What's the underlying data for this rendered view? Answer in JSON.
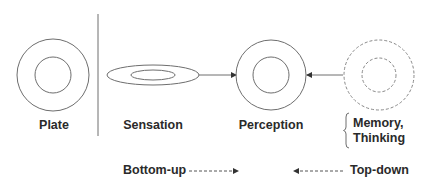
{
  "diagram": {
    "colors": {
      "stroke": "#6e6e6e",
      "dashed_stroke": "#888888",
      "text": "#2a2a2a",
      "background": "#ffffff"
    },
    "nodes": [
      {
        "id": "plate",
        "label": "Plate",
        "shape": "concentric-circles",
        "style": "solid"
      },
      {
        "id": "sensation",
        "label": "Sensation",
        "shape": "concentric-ellipses",
        "style": "solid"
      },
      {
        "id": "perception",
        "label": "Perception",
        "shape": "concentric-circles",
        "style": "solid"
      },
      {
        "id": "memory_thinking",
        "label_line1": "Memory,",
        "label_line2": "Thinking",
        "shape": "concentric-circles",
        "style": "dashed"
      }
    ],
    "edges": [
      {
        "from": "sensation",
        "to": "perception",
        "style": "solid"
      },
      {
        "from": "memory_thinking",
        "to": "perception",
        "style": "solid"
      }
    ],
    "legend": {
      "bottom_up": {
        "label": "Bottom-up",
        "arrow": "dashed-right"
      },
      "top_down": {
        "label": "Top-down",
        "arrow": "dashed-left"
      }
    }
  }
}
